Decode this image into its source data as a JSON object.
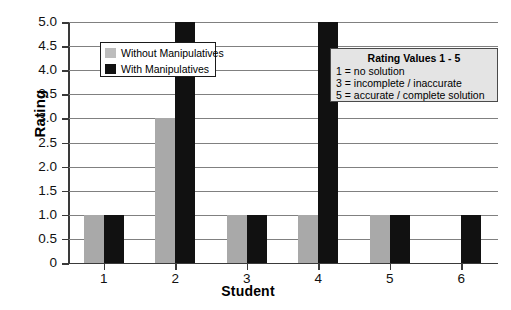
{
  "chart_data": {
    "type": "bar",
    "title": "",
    "xlabel": "Student",
    "ylabel": "Rating",
    "categories": [
      "1",
      "2",
      "3",
      "4",
      "5",
      "6"
    ],
    "series": [
      {
        "name": "Without Manipulatives",
        "color": "#a9a9a9",
        "values": [
          1,
          3,
          1,
          1,
          1,
          0
        ]
      },
      {
        "name": "With Manipulatives",
        "color": "#111111",
        "values": [
          1,
          5,
          1,
          5,
          1,
          1
        ]
      }
    ],
    "ylim": [
      0,
      5
    ],
    "ytick_labels": [
      "5.0",
      "4.5",
      "4.0",
      "3.5",
      "3.0",
      "2.5",
      "2.0",
      "1.5",
      "1.0",
      "0.5",
      "0"
    ],
    "ytick_values": [
      5.0,
      4.5,
      4.0,
      3.5,
      3.0,
      2.5,
      2.0,
      1.5,
      1.0,
      0.5,
      0
    ],
    "grid": "horizontal",
    "legend_position": "upper-left-inside"
  },
  "legend": {
    "entries": [
      {
        "label": "Without Manipulatives",
        "swatch": "gray"
      },
      {
        "label": "With Manipulatives",
        "swatch": "black"
      }
    ]
  },
  "rating_box": {
    "title": "Rating Values 1 - 5",
    "lines": [
      "1 = no solution",
      "3 = incomplete / inaccurate",
      "5 = accurate / complete solution"
    ]
  }
}
